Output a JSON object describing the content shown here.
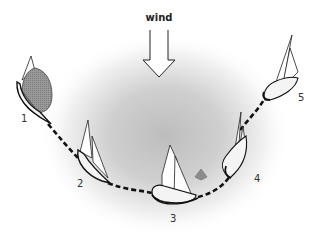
{
  "diagram": {
    "wind": {
      "label": "wind",
      "direction": "down",
      "icon": "arrow-down-outline-icon"
    },
    "colors": {
      "background": "#ffffff",
      "wind_shadow": "#bdbdbd",
      "sail_fill": "#ffffff",
      "hull_fill": "#f4f4f4",
      "outline": "#222222",
      "spinnaker_fill": "#8a8a8a",
      "mark_fill": "#8c8c8c",
      "path_stroke": "#111111"
    },
    "boats": [
      {
        "id": "1",
        "label": "1",
        "description": "boat with spinnaker set, running"
      },
      {
        "id": "2",
        "label": "2",
        "description": "boat reaching"
      },
      {
        "id": "3",
        "label": "3",
        "description": "boat rounding near mark, head to wind"
      },
      {
        "id": "4",
        "label": "4",
        "description": "boat close-hauled"
      },
      {
        "id": "5",
        "label": "5",
        "description": "boat close-hauled, beating upwind"
      }
    ],
    "mark": {
      "label": "",
      "icon": "buoy-mark-icon"
    },
    "path": {
      "style": "dashed",
      "connects": [
        "1",
        "2",
        "3",
        "4",
        "5"
      ]
    }
  }
}
